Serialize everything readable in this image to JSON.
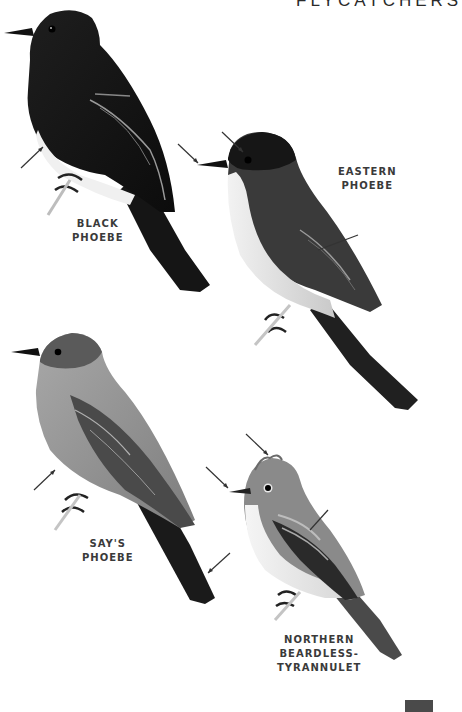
{
  "page": {
    "running_head": "FLYCATCHERS",
    "page_tab_color": "#4a4a4a"
  },
  "species": [
    {
      "id": "black-phoebe",
      "label_lines": [
        "BLACK",
        "PHOEBE"
      ]
    },
    {
      "id": "eastern-phoebe",
      "label_lines": [
        "EASTERN",
        "PHOEBE"
      ]
    },
    {
      "id": "says-phoebe",
      "label_lines": [
        "SAY'S",
        "PHOEBE"
      ]
    },
    {
      "id": "northern-beardless-tyrannulet",
      "label_lines": [
        "NORTHERN",
        "BEARDLESS-",
        "TYRANNULET"
      ]
    }
  ]
}
